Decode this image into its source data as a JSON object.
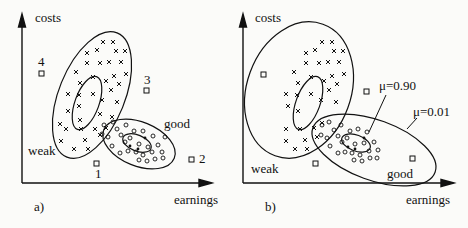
{
  "panels": [
    {
      "id": "a",
      "caption": "a)",
      "y_axis_label": "costs",
      "x_axis_label": "earnings",
      "cluster_labels": {
        "weak": "weak",
        "good": "good"
      },
      "outliers": [
        {
          "label": "1",
          "x": 96,
          "y": 163
        },
        {
          "label": "2",
          "x": 191,
          "y": 158
        },
        {
          "label": "3",
          "x": 147,
          "y": 90
        },
        {
          "label": "4",
          "x": 41,
          "y": 72
        }
      ]
    },
    {
      "id": "b",
      "caption": "b)",
      "y_axis_label": "costs",
      "x_axis_label": "earnings",
      "cluster_labels": {
        "weak": "weak",
        "good": "good"
      },
      "membership_labels": {
        "inner": "μ=0.90",
        "outer": "μ=0.01"
      },
      "outliers_unlabeled": [
        {
          "x": 29,
          "y": 74
        },
        {
          "x": 132,
          "y": 91
        },
        {
          "x": 81,
          "y": 163
        },
        {
          "x": 178,
          "y": 158
        }
      ]
    }
  ],
  "colors": {
    "ink": "#111111",
    "paper": "#fbfbf9"
  }
}
